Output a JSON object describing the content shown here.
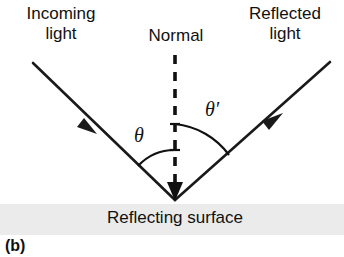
{
  "figure": {
    "panel_label": "(b)",
    "labels": {
      "incoming": "Incoming\nlight",
      "incoming_line1": "Incoming",
      "incoming_line2": "light",
      "normal": "Normal",
      "reflected_line1": "Reflected",
      "reflected_line2": "light",
      "surface": "Reflecting surface",
      "angle_incidence": "θ",
      "angle_reflection": "θ′"
    },
    "colors": {
      "background": "#ffffff",
      "ink": "#111111",
      "surface_band": "#ebebeb",
      "ray": "#1a1a1a"
    },
    "geometry": {
      "vertex_x": 175,
      "vertex_y": 200,
      "normal_top_y": 55,
      "incoming_start_x": 33,
      "incoming_start_y": 63,
      "reflected_end_x": 330,
      "reflected_end_y": 62,
      "arc_left_radius": 50,
      "arc_right_radius": 76,
      "surface_band_top": 204,
      "surface_band_bottom": 235
    }
  }
}
